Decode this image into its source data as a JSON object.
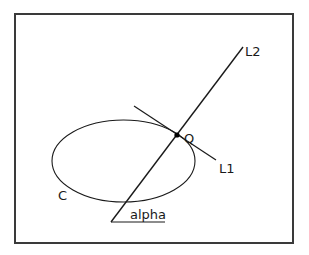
{
  "diagram": {
    "frame": {
      "x": 15,
      "y": 14,
      "width": 278,
      "height": 229,
      "stroke": "#3a3a3a"
    },
    "ellipse": {
      "name": "C",
      "cx": 123.5,
      "cy": 161,
      "rx": 71.5,
      "ry": 41
    },
    "lines": {
      "L1": {
        "x1": 134,
        "y1": 106,
        "x2": 216,
        "y2": 160
      },
      "L2": {
        "x1": 111,
        "y1": 222,
        "x2": 243,
        "y2": 47
      },
      "baseline": {
        "x1": 111,
        "y1": 222,
        "x2": 165,
        "y2": 222
      }
    },
    "point": {
      "name": "Q",
      "x": 177,
      "y": 135
    },
    "labels": {
      "L2": "L2",
      "L1": "L1",
      "Q": "Q",
      "C": "C",
      "alpha": "alpha"
    },
    "stroke_color": "#1a1a1a"
  }
}
